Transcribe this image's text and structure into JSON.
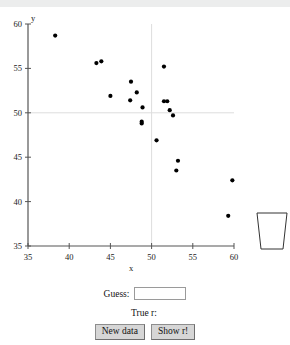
{
  "chart_data": {
    "type": "scatter",
    "title": "",
    "xlabel": "x",
    "ylabel": "y",
    "xlim": [
      35,
      60
    ],
    "ylim": [
      35,
      60
    ],
    "xticks": [
      35,
      40,
      45,
      50,
      55,
      60
    ],
    "yticks": [
      35,
      40,
      45,
      50,
      55,
      60
    ],
    "grid": "mean crosshair at x=50, y=50",
    "gridlines": {
      "vertical_x": 50,
      "horizontal_y": 50
    },
    "legend": "none",
    "points": [
      {
        "x": 38.3,
        "y": 58.7
      },
      {
        "x": 43.3,
        "y": 55.6
      },
      {
        "x": 43.9,
        "y": 55.8
      },
      {
        "x": 45.0,
        "y": 51.9
      },
      {
        "x": 47.5,
        "y": 53.5
      },
      {
        "x": 47.4,
        "y": 51.4
      },
      {
        "x": 48.2,
        "y": 52.3
      },
      {
        "x": 48.9,
        "y": 50.6
      },
      {
        "x": 48.8,
        "y": 49.0
      },
      {
        "x": 48.8,
        "y": 48.8
      },
      {
        "x": 50.6,
        "y": 46.9
      },
      {
        "x": 51.5,
        "y": 55.2
      },
      {
        "x": 51.5,
        "y": 51.3
      },
      {
        "x": 51.9,
        "y": 51.3
      },
      {
        "x": 52.2,
        "y": 50.3
      },
      {
        "x": 52.6,
        "y": 49.7
      },
      {
        "x": 53.2,
        "y": 44.6
      },
      {
        "x": 53.0,
        "y": 43.5
      },
      {
        "x": 59.8,
        "y": 42.4
      },
      {
        "x": 59.3,
        "y": 38.4
      }
    ]
  },
  "trash": {
    "label": "Trash"
  },
  "controls": {
    "guess_label": "Guess:",
    "guess_value": "",
    "guess_placeholder": "",
    "true_r_label": "True r:",
    "true_r_value": "",
    "new_data_button": "New data",
    "show_r_button": "Show r!"
  }
}
